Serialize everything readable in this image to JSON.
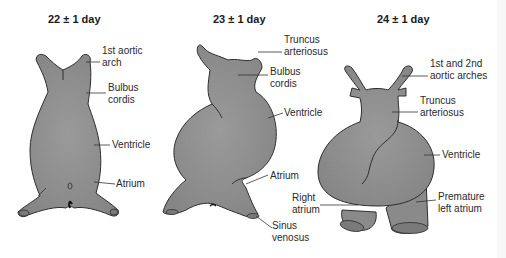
{
  "figure": {
    "panels": [
      {
        "title": "22 ± 1 day",
        "labels": [
          "1st aortic\narch",
          "Bulbus\ncordis",
          "Ventricle",
          "Atrium"
        ]
      },
      {
        "title": "23 ± 1 day",
        "labels": [
          "Truncus\narteriosus",
          "Bulbus\ncordis",
          "Ventricle",
          "Atrium",
          "Sinus\nvenosus"
        ]
      },
      {
        "title": "24 ± 1 day",
        "labels": [
          "1st and 2nd\naortic arches",
          "Truncus\narteriosus",
          "Ventricle",
          "Right\natrium",
          "Premature\nleft atrium"
        ]
      }
    ],
    "colors": {
      "tissue_fill": "#8c8c8c",
      "tissue_stroke": "#2e2e2e",
      "leader_line": "#333333",
      "background": "#ffffff"
    }
  }
}
